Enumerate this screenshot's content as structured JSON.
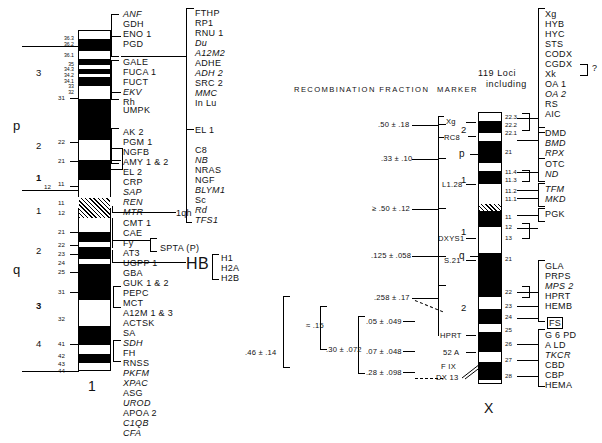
{
  "figure": {
    "headers": {
      "recombination_fraction": "RECOMBINATION  FRACTION",
      "marker": "MARKER",
      "loci_line1": "119 Loci",
      "loci_line2": "including"
    },
    "chromosome1": {
      "name": "1",
      "arms": {
        "p": "p",
        "q": "q"
      },
      "p_regions": [
        "3",
        "2",
        "1"
      ],
      "q_regions": [
        "1",
        "2",
        "3",
        "4"
      ],
      "p_subband_small": [
        "36.3",
        "36.2",
        "36.1",
        "35",
        "34.3",
        "34.2",
        "34.1",
        "33",
        "32"
      ],
      "p_bands": [
        "31",
        "22",
        "21",
        "12",
        "11"
      ],
      "q_bands": [
        "11",
        "12",
        "21",
        "22",
        "23",
        "24",
        "25",
        "31",
        "32",
        "41",
        "42",
        "43",
        "44"
      ],
      "heterochromatin_label": "1qh",
      "gene_group_1": [
        "ANF",
        "GDH",
        "ENO 1",
        "PGD"
      ],
      "gene_group_2": [
        "GALE",
        "FUCA 1",
        "FUCT",
        "EKV",
        "Rh"
      ],
      "gene_group_3": [
        "UMPK"
      ],
      "gene_group_4": [
        "AK 2",
        "PGM 1",
        "NGFB",
        "AMY 1 & 2",
        "EL 2",
        "CRP",
        "SAP",
        "REN",
        "MTR"
      ],
      "gene_group_5": [
        "CMT 1",
        "CAE",
        "Fy",
        "AT3",
        "UGPP 1"
      ],
      "gene_group_6": [
        "GBA",
        "GUK 1 & 2",
        "PEPC",
        "MCT",
        "A12M 1 & 3",
        "ACTSK",
        "SA",
        "SDH",
        "FH"
      ],
      "gene_group_7": [
        "RNSS",
        "PKFM",
        "XPAC",
        "ASG",
        "UROD",
        "APOA 2",
        "C1QB",
        "CFA"
      ],
      "spta_label": "SPTA (P)",
      "histone": {
        "label": "HB",
        "members": [
          "H1",
          "H2A",
          "H2B"
        ]
      },
      "italic_genes": [
        "ANF",
        "EKV",
        "SAP",
        "REN",
        "MTR",
        "SDH",
        "PKFM",
        "XPAC",
        "UROD",
        "C1QB",
        "CFA",
        "Du",
        "A12M2",
        "ADH 2",
        "MMC",
        "NB",
        "BLYM1",
        "Rd",
        "TFS1"
      ],
      "midcol_group_1": [
        "FTHP",
        "RP1",
        "RNU 1",
        "Du",
        "A12M2",
        "ADHE",
        "ADH 2",
        "SRC 2",
        "MMC",
        "In Lu"
      ],
      "midcol_group_2": [
        "EL 1"
      ],
      "midcol_group_3": [
        "C8",
        "NB",
        "NRAS",
        "NGF",
        "BLYM1",
        "Sc",
        "Rd",
        "TFS1"
      ]
    },
    "chromosomeX": {
      "name": "X",
      "arms": {
        "p": "p",
        "q": "q"
      },
      "p_regions": [
        "2",
        "1"
      ],
      "q_regions": [
        "1",
        "2"
      ],
      "p_bands": [
        "22.3",
        "22.2",
        "22.1",
        "21",
        "11.4",
        "11.3",
        "11.2",
        "11.1"
      ],
      "q_bands": [
        "11",
        "12",
        "13",
        "21",
        "22",
        "23",
        "24",
        "25",
        "26",
        "27",
        "28"
      ],
      "markers": [
        "Xg",
        "RC8",
        "L1.28",
        "DXYS1",
        "S.21",
        "HPRT",
        "52 A",
        "F IX",
        "DX 13"
      ],
      "recombination_values": [
        ".50 ± .18",
        ".33 ± .10",
        "≥ .50 ± .12",
        ".125 ± .058",
        ".258 ± .17",
        ".05 ± .049",
        ".07 ± .048",
        ".28 ± .098",
        "≈ .15",
        ".30 ± .072",
        ".46 ± .14"
      ],
      "loci": [
        "Xg",
        "HYB",
        "HYC",
        "STS",
        "CODX",
        "CGDX",
        "Xk",
        "OA 1",
        "OA 2",
        "RS",
        "AIC",
        "DMD",
        "BMD",
        "RPX",
        "OTC",
        "ND",
        "TFM",
        "MKD",
        "PGK",
        "GLA",
        "PRPS",
        "MPS 2",
        "HPRT",
        "HEMB",
        "FS",
        "G 6 PD",
        "A LD",
        "TKCR",
        "CBD",
        "CBP",
        "HEMA"
      ],
      "italic_loci": [
        "OA 2",
        "BMD",
        "RPX",
        "ND",
        "TFM",
        "MKD",
        "MPS 2",
        "TKCR"
      ],
      "boxed_locus": "FS",
      "query_marker": "?"
    }
  },
  "colors": {
    "ink": "#000000",
    "paper": "#ffffff"
  }
}
